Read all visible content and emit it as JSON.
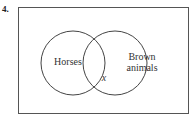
{
  "problem": {
    "number": "4."
  },
  "venn": {
    "sets": [
      {
        "label": "Horses"
      },
      {
        "label_line1": "Brown",
        "label_line2": "animals"
      }
    ],
    "intersection_label": "x",
    "stroke_color": "#444444"
  }
}
